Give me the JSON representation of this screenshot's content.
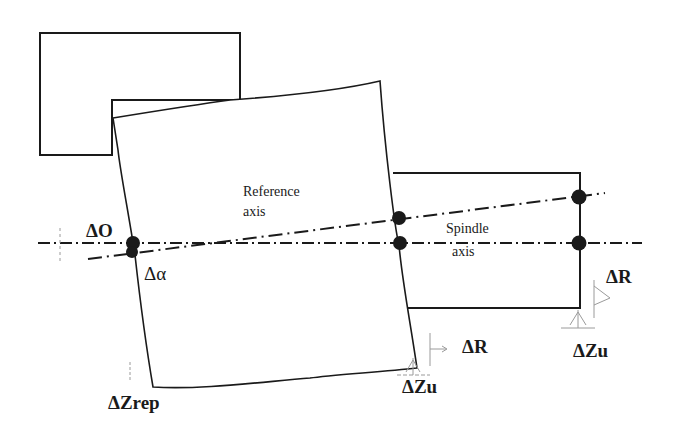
{
  "diagram": {
    "labels": {
      "reference_axis_line1": "Reference",
      "reference_axis_line2": "axis",
      "spindle_axis_line1": "Spindle",
      "spindle_axis_line2": "axis",
      "delta_o": "ΔO",
      "delta_alpha": "Δα",
      "delta_zrep": "ΔZrep",
      "delta_r_mid": "ΔR",
      "delta_r_right": "ΔR",
      "delta_zu_mid": "ΔZu",
      "delta_zu_right": "ΔZu"
    },
    "colors": {
      "line": "#1a1a1a",
      "faint": "#9a9a9a",
      "background": "#ffffff"
    }
  }
}
